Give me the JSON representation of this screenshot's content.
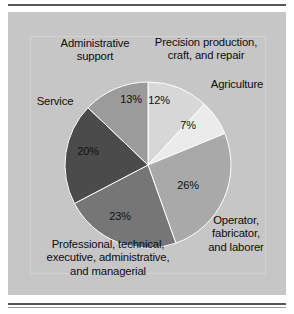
{
  "figure": {
    "background_color": "#ffffff",
    "panel_color": "#c6c6c6",
    "rule_color": "#55575a"
  },
  "chart_data": {
    "type": "pie",
    "title": "",
    "subtitle": "",
    "xlabel": "",
    "ylabel": "",
    "legend_position": "none",
    "grid": false,
    "start_angle_deg": 0,
    "direction": "clockwise",
    "categories": [
      "Precision production, craft, and repair",
      "Agriculture",
      "Operator, fabricator, and laborer",
      "Professional, technical, executive, administrative, and managerial",
      "Service",
      "Administrative support"
    ],
    "values": [
      12,
      7,
      26,
      23,
      20,
      13
    ],
    "value_labels": [
      "12%",
      "7%",
      "26%",
      "23%",
      "20%",
      "13%"
    ],
    "colors": [
      "#d7d7d7",
      "#ebebeb",
      "#a9a9a9",
      "#767676",
      "#4b4b4b",
      "#9b9b9b"
    ],
    "slices": [
      {
        "name": "Precision production, craft, and repair",
        "value": 12,
        "value_label": "12%",
        "color": "#d7d7d7",
        "label_lines": [
          "Precision production,",
          "craft, and repair"
        ]
      },
      {
        "name": "Agriculture",
        "value": 7,
        "value_label": "7%",
        "color": "#ebebeb",
        "label_lines": [
          "Agriculture"
        ]
      },
      {
        "name": "Operator, fabricator, and laborer",
        "value": 26,
        "value_label": "26%",
        "color": "#a9a9a9",
        "label_lines": [
          "Operator,",
          "fabricator,",
          "and laborer"
        ]
      },
      {
        "name": "Professional, technical, executive, administrative, and managerial",
        "value": 23,
        "value_label": "23%",
        "color": "#767676",
        "label_lines": [
          "Professional, technical,",
          "executive, administrative,",
          "and managerial"
        ]
      },
      {
        "name": "Service",
        "value": 20,
        "value_label": "20%",
        "color": "#4b4b4b",
        "label_lines": [
          "Service"
        ]
      },
      {
        "name": "Administrative support",
        "value": 13,
        "value_label": "13%",
        "color": "#9b9b9b",
        "label_lines": [
          "Administrative",
          "support"
        ]
      }
    ]
  },
  "labels": {
    "precision": "Precision production,\ncraft, and repair",
    "agriculture": "Agriculture",
    "operator": "Operator,\nfabricator,\nand laborer",
    "professional": "Professional, technical,\nexecutive, administrative,\nand managerial",
    "service": "Service",
    "administrative_support": "Administrative\nsupport"
  },
  "percent_labels": {
    "precision": "12%",
    "agriculture": "7%",
    "operator": "26%",
    "professional": "23%",
    "service": "20%",
    "administrative_support": "13%"
  }
}
